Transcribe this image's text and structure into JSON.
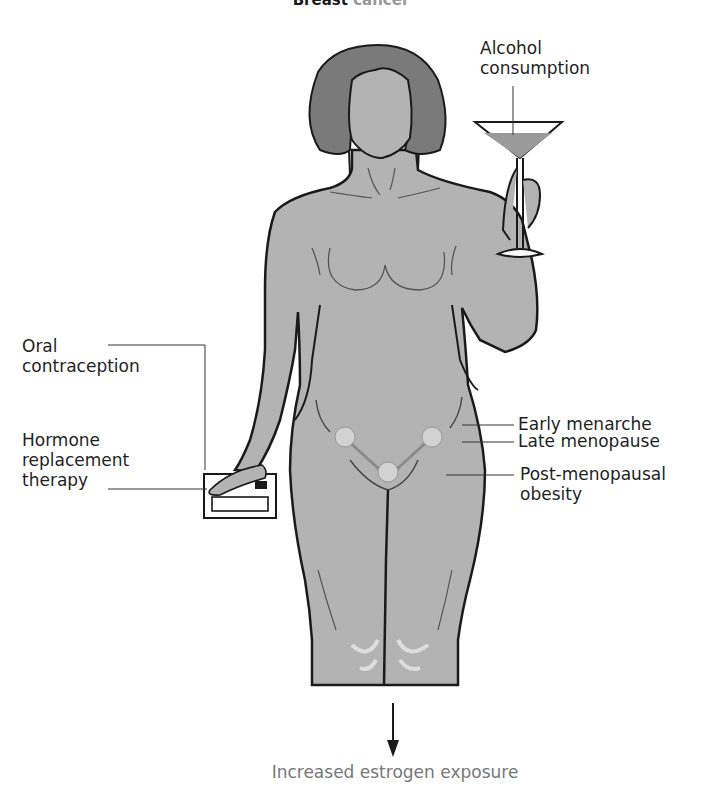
{
  "title": {
    "visible_text": "Breast",
    "faded_text": "cancer"
  },
  "labels": {
    "alcohol": "Alcohol\nconsumption",
    "oral_contraception": "Oral\ncontraception",
    "hrt": "Hormone\nreplacement\ntherapy",
    "early_menarche": "Early menarche",
    "late_menopause": "Late menopause",
    "pm_obesity": "Post-menopausal\nobesity",
    "outcome": "Increased estrogen exposure"
  },
  "colors": {
    "skin": "#b3b3b3",
    "hair": "#7a7a7a",
    "outline": "#1a1a1a",
    "ovary": "#d2d2d2",
    "drink": "#9a9a9a",
    "outcome_text": "#777777"
  }
}
